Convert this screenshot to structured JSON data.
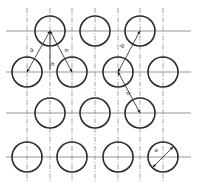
{
  "drawing": {
    "type": "engineering-hole-pattern",
    "description": "Staggered circular hole pattern with centerlines and dimension callouts",
    "canvas": {
      "width": 197,
      "height": 190,
      "background": "#ffffff"
    },
    "colors": {
      "circle_stroke": "#2b2b2b",
      "centerline": "#8a8a8a",
      "dimension": "#3a3a3a",
      "text": "#1c1c1c"
    },
    "circle_radius": 15,
    "rows": [
      {
        "name": "row-1",
        "cy": 31,
        "count": 3,
        "centers_x": [
          50,
          95,
          140
        ]
      },
      {
        "name": "row-2",
        "cy": 72,
        "count": 4,
        "centers_x": [
          27,
          72,
          118,
          163
        ]
      },
      {
        "name": "row-3",
        "cy": 113,
        "count": 3,
        "centers_x": [
          50,
          95,
          140
        ]
      },
      {
        "name": "row-4",
        "cy": 157,
        "count": 4,
        "centers_x": [
          27,
          72,
          118,
          163
        ]
      }
    ],
    "horizontal_centerlines_y": [
      31,
      72,
      113,
      157
    ],
    "vertical_centerlines_x": [
      27,
      50,
      72,
      95,
      118,
      140,
      163
    ],
    "dimensions": [
      {
        "id": "pitch-diagonal-left",
        "label": "a",
        "label_x": 33,
        "label_y": 51,
        "from": {
          "x": 27,
          "y": 72
        },
        "to": {
          "x": 50,
          "y": 31
        },
        "kind": "diagonal-pitch"
      },
      {
        "id": "pitch-diagonal-right",
        "label": "a",
        "label_x": 65,
        "label_y": 51,
        "from": {
          "x": 72,
          "y": 72
        },
        "to": {
          "x": 50,
          "y": 31
        },
        "kind": "diagonal-pitch"
      },
      {
        "id": "pitch-vertical",
        "label": "a",
        "label_x": 52,
        "label_y": 64,
        "from": {
          "x": 50,
          "y": 31
        },
        "to": {
          "x": 50,
          "y": 72
        },
        "kind": "vertical-pitch"
      },
      {
        "id": "pitch-upper-right",
        "label": "b",
        "label_x": 123,
        "label_y": 47,
        "from": {
          "x": 118,
          "y": 72
        },
        "to": {
          "x": 140,
          "y": 31
        },
        "kind": "diagonal-pitch"
      },
      {
        "id": "pitch-lower-right",
        "label": "a",
        "label_x": 126,
        "label_y": 93,
        "from": {
          "x": 118,
          "y": 72
        },
        "to": {
          "x": 140,
          "y": 113
        },
        "kind": "diagonal-pitch"
      }
    ],
    "diameter_callout": {
      "id": "hole-diameter",
      "label": "ø",
      "label_x": 155,
      "label_y": 151,
      "circle_center": {
        "x": 163,
        "y": 157
      },
      "arrow_from": {
        "x": 153,
        "y": 167
      },
      "arrow_to": {
        "x": 173,
        "y": 147
      }
    }
  }
}
